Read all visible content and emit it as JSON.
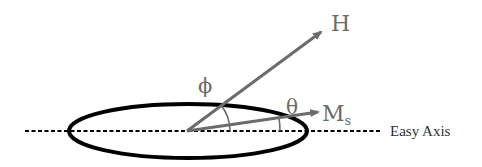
{
  "diagram": {
    "labels": {
      "field": "H",
      "magnetization_main": "M",
      "magnetization_sub": "s",
      "phi": "ϕ",
      "theta": "θ",
      "easy_axis": "Easy Axis"
    },
    "colors": {
      "arrow": "#6b6b6b",
      "ellipse": "#000000",
      "axis": "#000000",
      "easy_axis_text": "#333333"
    },
    "geometry": {
      "origin": [
        187,
        131
      ],
      "ellipse": {
        "cx": 188,
        "cy": 131,
        "rx": 119,
        "ry": 27
      },
      "h_arrow_tip": [
        323,
        30
      ],
      "ms_arrow_tip": [
        320,
        112
      ],
      "axis_from": 25,
      "axis_to": 380
    }
  }
}
